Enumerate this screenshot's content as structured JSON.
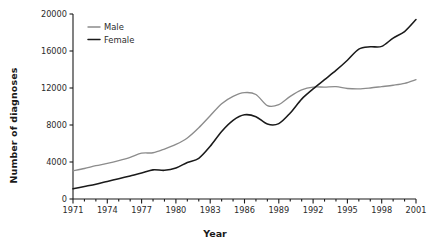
{
  "chart_data": {
    "type": "line",
    "title": "",
    "xlabel": "Year",
    "ylabel": "Number of diagnoses",
    "xlim": [
      1971,
      2001
    ],
    "ylim": [
      0,
      20000
    ],
    "grid": false,
    "legend_position": "top-left",
    "x": [
      1971,
      1972,
      1973,
      1974,
      1975,
      1976,
      1977,
      1978,
      1979,
      1980,
      1981,
      1982,
      1983,
      1984,
      1985,
      1986,
      1987,
      1988,
      1989,
      1990,
      1991,
      1992,
      1993,
      1994,
      1995,
      1996,
      1997,
      1998,
      1999,
      2000,
      2001
    ],
    "xticks": [
      1971,
      1974,
      1977,
      1980,
      1983,
      1986,
      1989,
      1992,
      1995,
      1998,
      2001
    ],
    "xticklabels": [
      "1971",
      "1974",
      "1977",
      "1980",
      "1983",
      "1986",
      "1989",
      "1992",
      "1995",
      "1998",
      "2001"
    ],
    "yticks": [
      0,
      4000,
      8000,
      12000,
      16000,
      20000
    ],
    "yticklabels": [
      "0",
      "4000",
      "8000",
      "12000",
      "16000",
      "20000"
    ],
    "series": [
      {
        "name": "Male",
        "color": "#8c8c8c",
        "values": [
          3050,
          3300,
          3600,
          3850,
          4150,
          4500,
          4950,
          5000,
          5400,
          5900,
          6600,
          7700,
          9000,
          10300,
          11100,
          11500,
          11300,
          10100,
          10200,
          11100,
          11800,
          12100,
          12100,
          12150,
          11950,
          11900,
          12000,
          12150,
          12300,
          12500,
          12900
        ]
      },
      {
        "name": "Female",
        "color": "#1a1a1a",
        "values": [
          1100,
          1350,
          1600,
          1900,
          2200,
          2500,
          2800,
          3150,
          3100,
          3350,
          3950,
          4400,
          5700,
          7300,
          8500,
          9100,
          8900,
          8100,
          8150,
          9300,
          10800,
          11900,
          12900,
          13900,
          15000,
          16200,
          16450,
          16500,
          17400,
          18100,
          19400
        ]
      }
    ],
    "legend": [
      {
        "label": "Male",
        "color": "#8c8c8c"
      },
      {
        "label": "Female",
        "color": "#1a1a1a"
      }
    ]
  }
}
